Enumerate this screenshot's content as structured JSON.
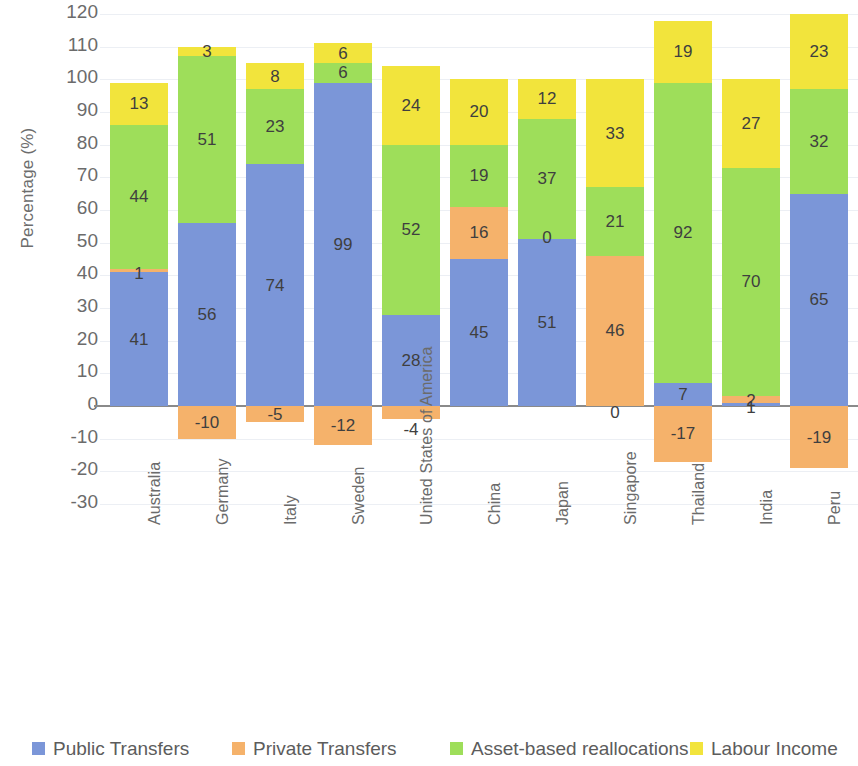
{
  "chart_data": {
    "type": "bar",
    "subtype": "stacked-bar-with-negative",
    "title": "",
    "xlabel": "",
    "ylabel": "Percentage (%)",
    "ylim": [
      -30,
      120
    ],
    "ytick_step": 10,
    "yticks": [
      "120",
      "110",
      "100",
      "90",
      "80",
      "70",
      "60",
      "50",
      "40",
      "30",
      "20",
      "10",
      "0",
      "-10",
      "-20",
      "-30"
    ],
    "grid": true,
    "legend_position": "bottom",
    "categories": [
      "Australia",
      "Germany",
      "Italy",
      "Sweden",
      "United States of America",
      "China",
      "Japan",
      "Singapore",
      "Thailand",
      "India",
      "Peru"
    ],
    "series": [
      {
        "name": "Public Transfers",
        "color": "#7b96d8",
        "values": [
          41,
          56,
          74,
          99,
          28,
          45,
          51,
          0,
          7,
          1,
          65
        ]
      },
      {
        "name": "Private Transfers",
        "color": "#f5b26b",
        "values": [
          1,
          -10,
          -5,
          -12,
          -4,
          16,
          0,
          46,
          -17,
          2,
          -19
        ]
      },
      {
        "name": "Asset-based reallocations",
        "color": "#9ede5a",
        "values": [
          44,
          51,
          23,
          6,
          52,
          19,
          37,
          21,
          92,
          70,
          32
        ]
      },
      {
        "name": "Labour Income",
        "color": "#f2e43c",
        "values": [
          13,
          3,
          8,
          6,
          24,
          20,
          12,
          33,
          19,
          27,
          23
        ]
      }
    ]
  },
  "legend": {
    "items": [
      {
        "label": "Public Transfers",
        "color": "#7b96d8"
      },
      {
        "label": "Private Transfers",
        "color": "#f5b26b"
      },
      {
        "label": "Asset-based reallocations",
        "color": "#9ede5a"
      },
      {
        "label": "Labour Income",
        "color": "#f2e43c"
      }
    ]
  }
}
